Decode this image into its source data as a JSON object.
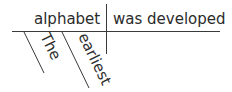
{
  "diagram": {
    "type": "sentence-diagram",
    "subject": "alphabet",
    "predicate": "was developed",
    "modifiers": [
      "The",
      "earliest"
    ],
    "line_color": "#3a3a3a",
    "text_color": "#2b2b2b"
  }
}
